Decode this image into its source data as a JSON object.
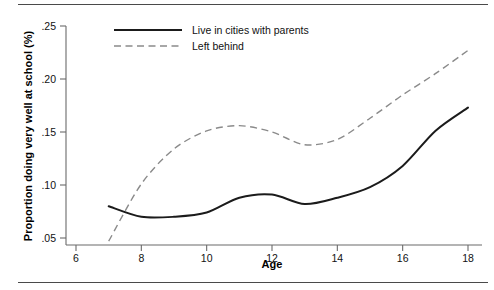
{
  "figure": {
    "has_top_rule": true,
    "has_bottom_rule": true,
    "background_color": "#ffffff"
  },
  "chart_data": {
    "type": "line",
    "title": "",
    "subtitle": "",
    "xlabel": "Age",
    "ylabel": "Proportion doing very well at school (%)",
    "xlim": [
      6,
      18
    ],
    "ylim": [
      0.05,
      0.25
    ],
    "xticks": [
      6,
      8,
      10,
      12,
      14,
      16,
      18
    ],
    "xticklabels": [
      "6",
      "8",
      "10",
      "12",
      "14",
      "16",
      "18"
    ],
    "yticks": [
      0.05,
      0.1,
      0.15,
      0.2,
      0.25
    ],
    "yticklabels": [
      ".05",
      ".10",
      ".15",
      ".20",
      ".25"
    ],
    "grid": false,
    "legend_position": "top-center",
    "x": [
      7,
      8,
      9,
      10,
      11,
      12,
      13,
      14,
      15,
      16,
      17,
      18
    ],
    "series": [
      {
        "name": "Live in cities with parents",
        "style": "solid",
        "color": "#1b1b1b",
        "x": [
          7,
          8,
          9,
          10,
          11,
          12,
          13,
          14,
          15,
          16,
          17,
          18
        ],
        "values": [
          0.08,
          0.07,
          0.07,
          0.074,
          0.088,
          0.091,
          0.082,
          0.088,
          0.098,
          0.118,
          0.151,
          0.173
        ]
      },
      {
        "name": "Left behind",
        "style": "dashed",
        "color": "#8a8a8a",
        "x": [
          7,
          8,
          9,
          10,
          11,
          12,
          13,
          14,
          15,
          16,
          17,
          18
        ],
        "values": [
          0.047,
          0.101,
          0.134,
          0.151,
          0.156,
          0.15,
          0.138,
          0.143,
          0.163,
          0.185,
          0.205,
          0.227
        ]
      }
    ],
    "legend": [
      {
        "label": "Live in cities with parents",
        "style": "solid",
        "color": "#1b1b1b"
      },
      {
        "label": "Left behind",
        "style": "dashed",
        "color": "#8a8a8a"
      }
    ]
  }
}
